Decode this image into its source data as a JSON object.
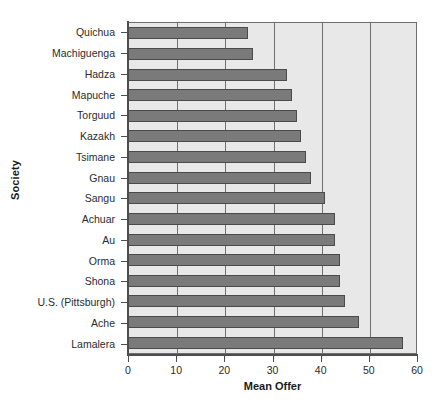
{
  "chart_data": {
    "type": "bar",
    "orientation": "horizontal",
    "title": "",
    "xlabel": "Mean Offer",
    "ylabel": "Society",
    "xlim": [
      0,
      60
    ],
    "xticks": [
      0,
      10,
      20,
      30,
      40,
      50,
      60
    ],
    "grid": true,
    "grid_axis": "x",
    "legend": false,
    "categories": [
      "Quichua",
      "Machiguenga",
      "Hadza",
      "Mapuche",
      "Torguud",
      "Kazakh",
      "Tsimane",
      "Gnau",
      "Sangu",
      "Achuar",
      "Au",
      "Orma",
      "Shona",
      "U.S. (Pittsburgh)",
      "Ache",
      "Lamalera"
    ],
    "values": [
      25,
      26,
      33,
      34,
      35,
      36,
      37,
      38,
      41,
      43,
      43,
      44,
      44,
      45,
      48,
      57
    ],
    "colors": {
      "bar_fill": "#7a7a7a",
      "bar_edge": "#4a4a4a",
      "plot_background": "#e8e8e8",
      "gridline": "#707070",
      "axis": "#4d4d4d",
      "text": "#2b2b2b",
      "page_background": "#ffffff"
    }
  }
}
